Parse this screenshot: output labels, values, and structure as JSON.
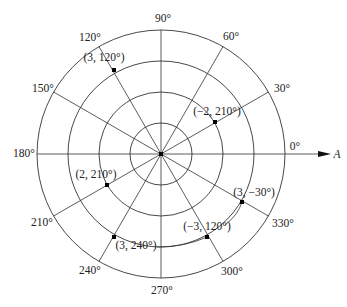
{
  "diagram": {
    "type": "polar-coordinate-grid",
    "center": {
      "x": 161,
      "y": 154
    },
    "ring_radii": [
      31,
      62,
      93,
      124
    ],
    "polar_axis_label": "A",
    "angle_labels": [
      {
        "text": "0°",
        "deg": 0
      },
      {
        "text": "30°",
        "deg": 30
      },
      {
        "text": "60°",
        "deg": 60
      },
      {
        "text": "90°",
        "deg": 90
      },
      {
        "text": "120°",
        "deg": 120
      },
      {
        "text": "150°",
        "deg": 150
      },
      {
        "text": "180°",
        "deg": 180
      },
      {
        "text": "210°",
        "deg": 210
      },
      {
        "text": "240°",
        "deg": 240
      },
      {
        "text": "270°",
        "deg": 270
      },
      {
        "text": "300°",
        "deg": 300
      },
      {
        "text": "330°",
        "deg": 330
      }
    ],
    "points": [
      {
        "label": "(3, 120°)",
        "r": 3,
        "theta_deg": 120
      },
      {
        "label": "(−2, 210°)",
        "r": -2,
        "theta_deg": 210
      },
      {
        "label": "(2, 210°)",
        "r": 2,
        "theta_deg": 210
      },
      {
        "label": "(3, 240°)",
        "r": 3,
        "theta_deg": 240
      },
      {
        "label": "(3, −30°)",
        "r": 3,
        "theta_deg": -30
      },
      {
        "label": "(−3, 120°)",
        "r": -3,
        "theta_deg": 120
      }
    ],
    "colors": {
      "line": "#333333",
      "point": "#000000",
      "text": "#222222"
    }
  }
}
